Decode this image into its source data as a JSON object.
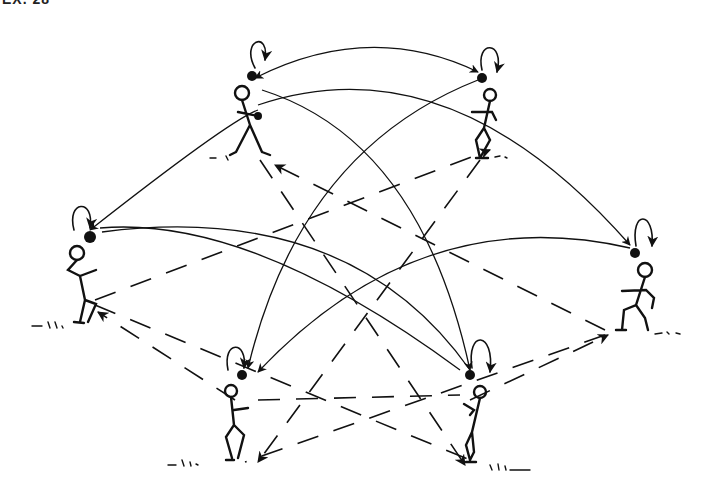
{
  "figure": {
    "header_text_cropped": "EX. 28",
    "ink_color": "#111111",
    "background_color": "#ffffff"
  },
  "players": [
    {
      "id": "top-left",
      "x": 245,
      "y": 110,
      "ball": [
        252,
        76
      ]
    },
    {
      "id": "top-right",
      "x": 488,
      "y": 110,
      "ball": [
        482,
        78
      ]
    },
    {
      "id": "mid-left",
      "x": 80,
      "y": 270,
      "ball": [
        90,
        237
      ]
    },
    {
      "id": "mid-right",
      "x": 640,
      "y": 285,
      "ball": [
        635,
        253
      ]
    },
    {
      "id": "bottom-left",
      "x": 235,
      "y": 410,
      "ball": [
        242,
        375
      ]
    },
    {
      "id": "bottom-right",
      "x": 472,
      "y": 410,
      "ball": [
        470,
        375
      ]
    }
  ],
  "legend": {
    "solid_curve": "aerial pass",
    "dashed_line": "ground pass",
    "loop_arrow": "self toss"
  }
}
